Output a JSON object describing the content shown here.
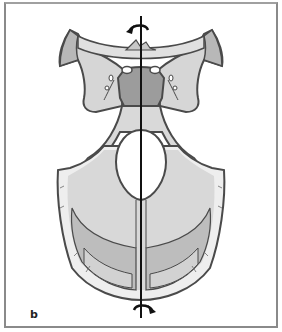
{
  "figure": {
    "panel_label": "b",
    "axis": "vertical-longitudinal-axis",
    "rotation_arrows": [
      "top-counterclockwise",
      "bottom-clockwise"
    ]
  },
  "colors": {
    "frame": "#8a8a8a",
    "bone_light": "#d9d9d9",
    "bone_mid": "#c4c4c4",
    "bone_dark": "#9c9c9c",
    "outline": "#4a4a4a",
    "axis": "#111111",
    "foramen": "#ffffff"
  }
}
